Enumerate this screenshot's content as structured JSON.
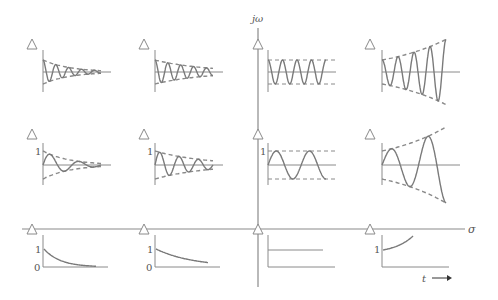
{
  "diagram": {
    "axes": {
      "real_label": "σ",
      "imag_label": "jω",
      "time_label": "t",
      "line_color": "#8a8a8a",
      "curve_color": "#7a7a7a",
      "dash_color": "#8a8a8a"
    },
    "pole_marker": "triangle-outline",
    "rows": [
      {
        "name": "high-frequency",
        "panels": [
          {
            "id": "r1c1",
            "type": "damped-oscillation",
            "cycles": 4.5,
            "decay": "fast",
            "label_one": ""
          },
          {
            "id": "r1c2",
            "type": "damped-oscillation",
            "cycles": 4.5,
            "decay": "slow",
            "label_one": ""
          },
          {
            "id": "r1c3",
            "type": "sustained-oscillation",
            "cycles": 4,
            "label_one": ""
          },
          {
            "id": "r1c4",
            "type": "growing-oscillation",
            "cycles": 4,
            "label_one": ""
          }
        ]
      },
      {
        "name": "low-frequency",
        "panels": [
          {
            "id": "r2c1",
            "type": "damped-oscillation",
            "cycles": 2,
            "decay": "fast",
            "label_one": "1"
          },
          {
            "id": "r2c2",
            "type": "damped-oscillation",
            "cycles": 3,
            "decay": "slow",
            "label_one": "1"
          },
          {
            "id": "r2c3",
            "type": "sustained-oscillation",
            "cycles": 1.75,
            "label_one": "1"
          },
          {
            "id": "r2c4",
            "type": "growing-oscillation",
            "cycles": 1.75,
            "label_one": ""
          }
        ]
      },
      {
        "name": "real-axis",
        "panels": [
          {
            "id": "r3c1",
            "type": "exponential-decay",
            "decay": "fast",
            "label_one": "1",
            "label_zero": "0"
          },
          {
            "id": "r3c2",
            "type": "exponential-decay",
            "decay": "slow",
            "label_one": "1",
            "label_zero": "0"
          },
          {
            "id": "r3c3",
            "type": "step",
            "label_one": "",
            "label_zero": ""
          },
          {
            "id": "r3c4",
            "type": "exponential-growth",
            "label_one": "1",
            "label_zero": ""
          }
        ]
      }
    ]
  }
}
